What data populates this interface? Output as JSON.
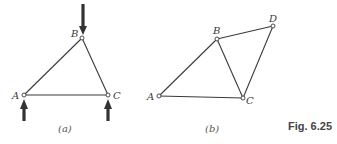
{
  "figure": {
    "caption": "Fig. 6.25",
    "panels": [
      {
        "id": "a",
        "label": "(a)",
        "joints": [
          {
            "name": "A",
            "x": 24,
            "y": 95
          },
          {
            "name": "B",
            "x": 82,
            "y": 38
          },
          {
            "name": "C",
            "x": 108,
            "y": 95
          }
        ],
        "members": [
          [
            "A",
            "B"
          ],
          [
            "B",
            "C"
          ],
          [
            "A",
            "C"
          ]
        ],
        "loads": [
          {
            "at": "B",
            "direction": "down"
          },
          {
            "at": "A",
            "direction": "up"
          },
          {
            "at": "C",
            "direction": "up"
          }
        ]
      },
      {
        "id": "b",
        "label": "(b)",
        "joints": [
          {
            "name": "A",
            "x": 159,
            "y": 96
          },
          {
            "name": "B",
            "x": 217,
            "y": 39
          },
          {
            "name": "C",
            "x": 243,
            "y": 98
          },
          {
            "name": "D",
            "x": 273,
            "y": 26
          }
        ],
        "members": [
          [
            "A",
            "B"
          ],
          [
            "B",
            "C"
          ],
          [
            "A",
            "C"
          ],
          [
            "B",
            "D"
          ],
          [
            "D",
            "C"
          ]
        ],
        "loads": []
      }
    ]
  }
}
